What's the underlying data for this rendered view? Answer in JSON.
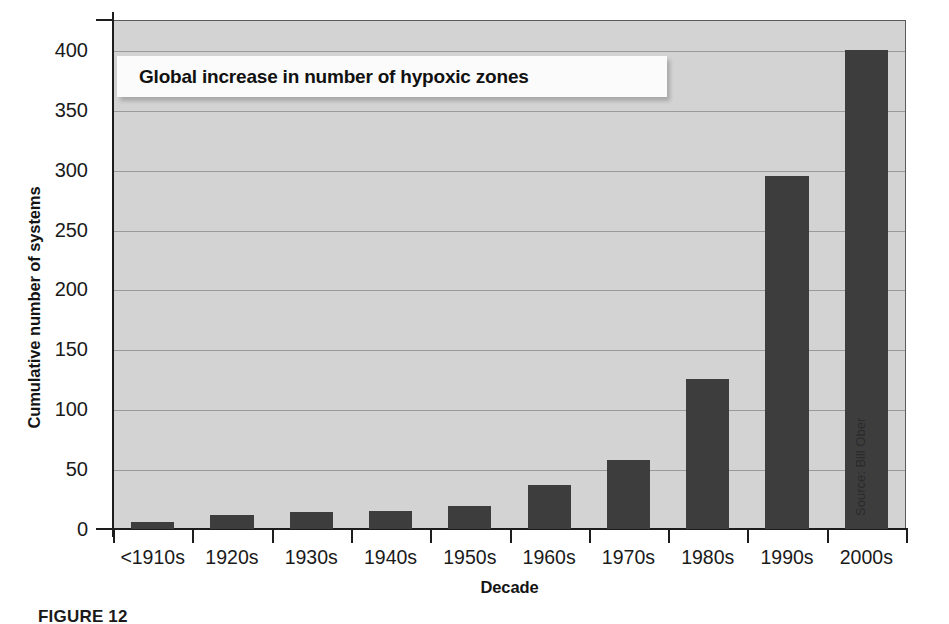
{
  "figure": {
    "caption": "FIGURE 12",
    "source_credit": "Source: Bill Ober"
  },
  "chart_data": {
    "type": "bar",
    "title": "Global increase in number of hypoxic zones",
    "xlabel": "Decade",
    "ylabel": "Cumulative number of systems",
    "categories": [
      "<1910s",
      "1920s",
      "1930s",
      "1940s",
      "1950s",
      "1960s",
      "1970s",
      "1980s",
      "1990s",
      "2000s"
    ],
    "values": [
      6,
      12,
      14,
      15,
      19,
      37,
      58,
      125,
      295,
      400
    ],
    "ylim": [
      0,
      425
    ],
    "yticks": [
      0,
      50,
      100,
      150,
      200,
      250,
      300,
      350,
      400
    ],
    "ytick_labels": [
      "0",
      "50",
      "100",
      "150",
      "200",
      "250",
      "300",
      "350",
      "400"
    ],
    "grid": true,
    "legend": false,
    "bar_color": "#3d3d3d",
    "plot_background": "#d3d3d3",
    "gridline_color": "#9a9a9a"
  }
}
